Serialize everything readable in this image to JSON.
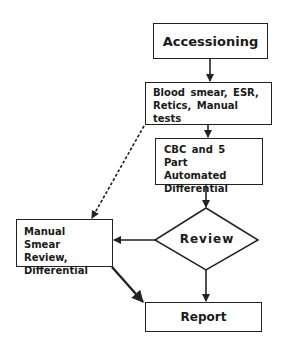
{
  "diagram": {
    "type": "flowchart",
    "nodes": {
      "accessioning": {
        "label": "Accessioning",
        "shape": "rectangle"
      },
      "blood_smear": {
        "label": "Blood smear,  ESR, Retics,  Manual tests",
        "shape": "rectangle"
      },
      "cbc": {
        "label": "CBC and 5 Part Automated Differential",
        "shape": "rectangle"
      },
      "review": {
        "label": "Review",
        "shape": "diamond"
      },
      "manual_smear": {
        "label": "Manual  Smear Review, Differential",
        "shape": "rectangle"
      },
      "report": {
        "label": "Report",
        "shape": "rectangle"
      }
    },
    "edges": [
      {
        "from": "accessioning",
        "to": "blood_smear",
        "style": "solid"
      },
      {
        "from": "blood_smear",
        "to": "cbc",
        "style": "solid"
      },
      {
        "from": "cbc",
        "to": "review",
        "style": "solid"
      },
      {
        "from": "review",
        "to": "manual_smear",
        "style": "solid"
      },
      {
        "from": "review",
        "to": "report",
        "style": "solid"
      },
      {
        "from": "blood_smear",
        "to": "manual_smear",
        "style": "dashed"
      },
      {
        "from": "manual_smear",
        "to": "report",
        "style": "solid-bold"
      }
    ],
    "colors": {
      "stroke": "#222222",
      "fill": "#ffffff",
      "text": "#1a1a1a"
    }
  }
}
